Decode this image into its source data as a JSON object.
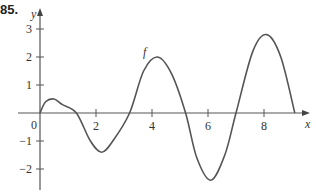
{
  "problem_number": "85.",
  "chart_data": {
    "type": "line",
    "title": "",
    "xlabel": "x",
    "ylabel": "y",
    "curve_label": "f",
    "xlim": [
      0,
      9.6
    ],
    "ylim": [
      -3,
      3.3
    ],
    "x_ticks": [
      2,
      4,
      6,
      8
    ],
    "x_tick_labels": [
      "2",
      "4",
      "6",
      "8"
    ],
    "y_ticks": [
      3,
      2,
      1,
      -1,
      -2
    ],
    "y_tick_labels": [
      "3",
      "2",
      "1",
      "−1",
      "−2"
    ],
    "origin_label": "0",
    "grid": false,
    "series": [
      {
        "name": "f",
        "x": [
          0,
          0.2,
          0.5,
          0.8,
          1.3,
          1.8,
          2.2,
          2.6,
          3.2,
          3.7,
          4.2,
          4.7,
          5.2,
          5.6,
          6.1,
          6.6,
          7.0,
          7.6,
          8.1,
          8.6,
          9.1
        ],
        "y": [
          0,
          0.4,
          0.5,
          0.3,
          0,
          -1.0,
          -1.4,
          -1.0,
          0,
          1.5,
          2.0,
          1.4,
          0,
          -1.6,
          -2.4,
          -1.5,
          0,
          2.2,
          2.8,
          2.0,
          0
        ]
      }
    ]
  }
}
